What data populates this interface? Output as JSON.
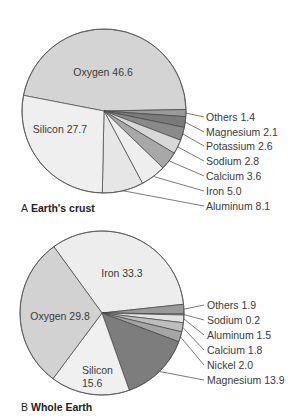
{
  "chart_data": [
    {
      "type": "pie",
      "title": "A Earth's crust",
      "caption_letter": "A",
      "caption_title": "Earth's crust",
      "slices": [
        {
          "label": "Oxygen",
          "value": 46.6,
          "color": "#d4d4d4"
        },
        {
          "label": "Others",
          "value": 1.4,
          "color": "#9a9a9a"
        },
        {
          "label": "Magnesium",
          "value": 2.1,
          "color": "#7a7a7a"
        },
        {
          "label": "Potassium",
          "value": 2.6,
          "color": "#8a8a8a"
        },
        {
          "label": "Sodium",
          "value": 2.8,
          "color": "#d8d8d8"
        },
        {
          "label": "Calcium",
          "value": 3.6,
          "color": "#a8a8a8"
        },
        {
          "label": "Iron",
          "value": 5.0,
          "color": "#eeeeee"
        },
        {
          "label": "Aluminum",
          "value": 8.1,
          "color": "#e6e6e6"
        },
        {
          "label": "Silicon",
          "value": 27.7,
          "color": "#efefef"
        }
      ]
    },
    {
      "type": "pie",
      "title": "B Whole Earth",
      "caption_letter": "B",
      "caption_title": "Whole Earth",
      "slices": [
        {
          "label": "Iron",
          "value": 33.3,
          "color": "#ededed"
        },
        {
          "label": "Others",
          "value": 1.9,
          "color": "#9a9a9a"
        },
        {
          "label": "Sodium",
          "value": 0.2,
          "color": "#cccccc"
        },
        {
          "label": "Aluminum",
          "value": 1.5,
          "color": "#e4e4e4"
        },
        {
          "label": "Calcium",
          "value": 1.8,
          "color": "#bdbdbd"
        },
        {
          "label": "Nickel",
          "value": 2.0,
          "color": "#a5a5a5"
        },
        {
          "label": "Magnesium",
          "value": 13.9,
          "color": "#7d7d7d"
        },
        {
          "label": "Silicon",
          "value": 15.6,
          "color": "#f0f0f0"
        },
        {
          "label": "Oxygen",
          "value": 29.8,
          "color": "#d2d2d2"
        }
      ]
    }
  ],
  "pieA": {
    "inner": [
      {
        "text": "Oxygen  46.6"
      },
      {
        "text": "Silicon  27.7"
      }
    ],
    "callouts": [
      {
        "text": "Others  1.4"
      },
      {
        "text": "Magnesium  2.1"
      },
      {
        "text": "Potassium  2.6"
      },
      {
        "text": "Sodium  2.8"
      },
      {
        "text": "Calcium  3.6"
      },
      {
        "text": "Iron  5.0"
      },
      {
        "text": "Aluminum  8.1"
      }
    ],
    "caption_letter": "A",
    "caption_title": "Earth's crust"
  },
  "pieB": {
    "inner": [
      {
        "text": "Iron  33.3"
      },
      {
        "text": "Oxygen  29.8"
      },
      {
        "text": "Silicon"
      },
      {
        "text": "15.6"
      }
    ],
    "callouts": [
      {
        "text": "Others  1.9"
      },
      {
        "text": "Sodium  0.2"
      },
      {
        "text": "Aluminum  1.5"
      },
      {
        "text": "Calcium  1.8"
      },
      {
        "text": "Nickel  2.0"
      },
      {
        "text": "Magnesium  13.9"
      }
    ],
    "caption_letter": "B",
    "caption_title": "Whole Earth"
  }
}
